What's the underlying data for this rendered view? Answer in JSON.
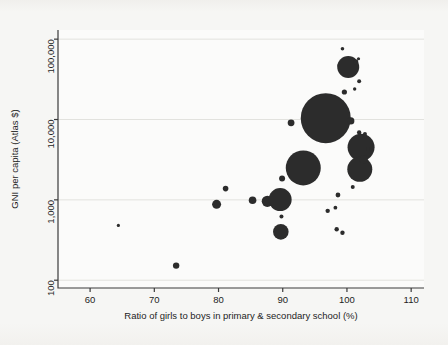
{
  "figure": {
    "background_color": "#f6f6f4",
    "plot_background_color": "#fbfbfa",
    "marker_color": "#2c2c2c",
    "grid_color": "#e2e2de",
    "axis_color": "#3a3a3a"
  },
  "chart_data": {
    "type": "scatter",
    "title": "",
    "subtitle": "",
    "xlabel": "Ratio of girls to boys in primary & secondary school (%)",
    "ylabel": "GNI per capita (Atlas $)",
    "xscale": "linear",
    "yscale": "log",
    "xlim": [
      55,
      112
    ],
    "ylim": [
      80,
      130000
    ],
    "grid": true,
    "grid_axis": "y",
    "legend": "none",
    "xticks": [
      60,
      70,
      80,
      90,
      100,
      110
    ],
    "xticklabels": [
      "60",
      "70",
      "80",
      "90",
      "100",
      "110"
    ],
    "yticks": [
      100,
      1000,
      10000,
      100000
    ],
    "yticklabels": [
      "100",
      "1,000",
      "10,000",
      "100,000"
    ],
    "size_encoding": "bubble area = population",
    "points": [
      {
        "x": 64.4,
        "y": 480,
        "r": 1.6
      },
      {
        "x": 73.4,
        "y": 152,
        "r": 3.2
      },
      {
        "x": 79.7,
        "y": 880,
        "r": 4.5
      },
      {
        "x": 81.1,
        "y": 1380,
        "r": 2.8
      },
      {
        "x": 85.3,
        "y": 990,
        "r": 3.8
      },
      {
        "x": 87.6,
        "y": 960,
        "r": 5.6
      },
      {
        "x": 89.6,
        "y": 1010,
        "r": 11.5
      },
      {
        "x": 89.7,
        "y": 400,
        "r": 7.8
      },
      {
        "x": 89.8,
        "y": 620,
        "r": 2.0
      },
      {
        "x": 89.9,
        "y": 1850,
        "r": 3.0
      },
      {
        "x": 91.3,
        "y": 9100,
        "r": 3.4
      },
      {
        "x": 93.2,
        "y": 2500,
        "r": 17.5
      },
      {
        "x": 96.7,
        "y": 10400,
        "r": 25.0
      },
      {
        "x": 97.0,
        "y": 730,
        "r": 2.2
      },
      {
        "x": 98.2,
        "y": 800,
        "r": 1.9
      },
      {
        "x": 98.6,
        "y": 1150,
        "r": 2.4
      },
      {
        "x": 98.4,
        "y": 430,
        "r": 2.2
      },
      {
        "x": 99.3,
        "y": 390,
        "r": 2.2
      },
      {
        "x": 99.3,
        "y": 76000,
        "r": 1.8
      },
      {
        "x": 99.0,
        "y": 47000,
        "r": 3.0
      },
      {
        "x": 99.6,
        "y": 22000,
        "r": 2.6
      },
      {
        "x": 100.2,
        "y": 45000,
        "r": 11.0
      },
      {
        "x": 101.4,
        "y": 52000,
        "r": 2.4
      },
      {
        "x": 101.8,
        "y": 57000,
        "r": 1.6
      },
      {
        "x": 101.9,
        "y": 30000,
        "r": 2.0
      },
      {
        "x": 101.2,
        "y": 24000,
        "r": 1.7
      },
      {
        "x": 100.6,
        "y": 9600,
        "r": 3.6
      },
      {
        "x": 101.9,
        "y": 6900,
        "r": 2.2
      },
      {
        "x": 102.8,
        "y": 6600,
        "r": 2.0
      },
      {
        "x": 102.2,
        "y": 4500,
        "r": 13.5
      },
      {
        "x": 102.0,
        "y": 2400,
        "r": 12.5
      },
      {
        "x": 102.6,
        "y": 3200,
        "r": 4.0
      },
      {
        "x": 103.3,
        "y": 4300,
        "r": 2.0
      },
      {
        "x": 100.9,
        "y": 1450,
        "r": 2.0
      }
    ]
  }
}
